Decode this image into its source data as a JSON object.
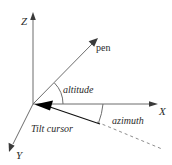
{
  "figure": {
    "background_color": "#ffffff",
    "line_color": "#6d6d6d",
    "dash_color": "#8d8d8d",
    "cursor_color": "#000000",
    "text_color": "#2b2b2b",
    "width": 172,
    "height": 165
  },
  "axes": {
    "z_label": "Z",
    "x_label": "X",
    "y_label": "Y"
  },
  "labels": {
    "pen": "pen",
    "altitude": "altitude",
    "azimuth": "azimuth",
    "tilt_cursor": "Tilt cursor"
  },
  "icons": {
    "z_axis_arrow": "arrowhead-up-icon",
    "x_axis_arrow": "arrowhead-right-icon",
    "y_axis_arrow": "arrowhead-down-left-icon",
    "pen_arrow": "arrowhead-up-right-icon",
    "tilt_cursor_arrow": "arrowhead-left-icon"
  },
  "geometry": {
    "origin": {
      "x": 33,
      "y": 104
    },
    "z_axis_tip": {
      "x": 33,
      "y": 14
    },
    "x_axis_tip": {
      "x": 158,
      "y": 104
    },
    "y_axis_tip": {
      "x": 9,
      "y": 149
    },
    "pen_tip": {
      "x": 97,
      "y": 39
    },
    "tilt_cursor_end": {
      "x": 100,
      "y": 124
    },
    "dashed_end": {
      "x": 162,
      "y": 149
    },
    "altitude_arc_radius": 30,
    "azimuth_arc_radius": 70
  }
}
